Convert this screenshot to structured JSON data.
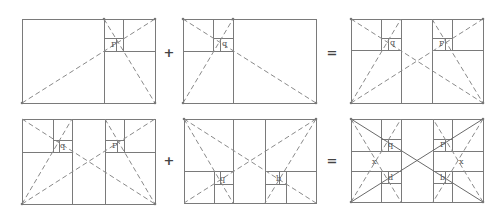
{
  "diagram": {
    "colors": {
      "line": "#7a7a7a",
      "dash": "#8a8a8a",
      "text": "#555555",
      "operator": "#444444",
      "background": "#ffffff"
    },
    "operators": [
      {
        "symbol": "+",
        "x": 169,
        "y": 57
      },
      {
        "symbol": "=",
        "x": 332,
        "y": 57
      },
      {
        "symbol": "+",
        "x": 169,
        "y": 165
      },
      {
        "symbol": "=",
        "x": 332,
        "y": 165
      }
    ],
    "panels": [
      {
        "id": "top-left",
        "rect": [
          22,
          19,
          155,
          103
        ],
        "lines": [
          [
            104,
            19,
            104,
            103
          ],
          [
            104,
            51,
            155,
            51
          ],
          [
            123,
            19,
            123,
            51
          ],
          [
            104,
            38,
            123,
            38
          ],
          [
            116,
            38,
            116,
            51
          ]
        ],
        "dashes": [
          [
            22,
            103,
            155,
            19
          ],
          [
            104,
            19,
            155,
            103
          ]
        ],
        "solids": [],
        "labels": [
          {
            "text": "P",
            "x": 111,
            "y": 47
          }
        ],
        "points": [
          [
            22,
            103
          ],
          [
            155,
            103
          ],
          [
            155,
            19
          ],
          [
            104,
            19
          ]
        ]
      },
      {
        "id": "top-middle",
        "rect": [
          183,
          19,
          316,
          103
        ],
        "lines": [
          [
            233,
            19,
            233,
            103
          ],
          [
            183,
            51,
            233,
            51
          ],
          [
            213,
            19,
            213,
            51
          ],
          [
            213,
            38,
            233,
            38
          ],
          [
            220,
            38,
            220,
            51
          ]
        ],
        "dashes": [
          [
            183,
            103,
            233,
            19
          ],
          [
            183,
            19,
            316,
            103
          ]
        ],
        "solids": [],
        "labels": [
          {
            "text": "q",
            "x": 222,
            "y": 46
          }
        ],
        "points": [
          [
            183,
            103
          ],
          [
            316,
            103
          ],
          [
            183,
            19
          ],
          [
            233,
            19
          ]
        ]
      },
      {
        "id": "top-right",
        "rect": [
          351,
          19,
          483,
          103
        ],
        "lines": [
          [
            401,
            19,
            401,
            103
          ],
          [
            432,
            19,
            432,
            103
          ],
          [
            351,
            50,
            401,
            50
          ],
          [
            381,
            19,
            381,
            50
          ],
          [
            381,
            38,
            401,
            38
          ],
          [
            388,
            38,
            388,
            50
          ],
          [
            432,
            50,
            483,
            50
          ],
          [
            452,
            19,
            452,
            50
          ],
          [
            432,
            38,
            452,
            38
          ],
          [
            445,
            38,
            445,
            50
          ]
        ],
        "dashes": [
          [
            351,
            103,
            483,
            19
          ],
          [
            351,
            19,
            483,
            103
          ],
          [
            351,
            103,
            401,
            19
          ],
          [
            432,
            19,
            483,
            103
          ]
        ],
        "solids": [],
        "labels": [
          {
            "text": "q",
            "x": 390,
            "y": 45
          },
          {
            "text": "P",
            "x": 439,
            "y": 46
          }
        ],
        "points": [
          [
            351,
            103
          ],
          [
            483,
            103
          ],
          [
            351,
            19
          ],
          [
            483,
            19
          ]
        ]
      },
      {
        "id": "bottom-left",
        "rect": [
          22,
          119,
          155,
          204
        ],
        "lines": [
          [
            72,
            119,
            72,
            204
          ],
          [
            105,
            119,
            105,
            204
          ],
          [
            22,
            152,
            72,
            152
          ],
          [
            53,
            119,
            53,
            152
          ],
          [
            53,
            140,
            72,
            140
          ],
          [
            59,
            140,
            59,
            152
          ],
          [
            105,
            152,
            155,
            152
          ],
          [
            124,
            119,
            124,
            152
          ],
          [
            105,
            140,
            124,
            140
          ],
          [
            117,
            140,
            117,
            152
          ]
        ],
        "dashes": [
          [
            22,
            204,
            155,
            119
          ],
          [
            22,
            119,
            155,
            204
          ],
          [
            22,
            204,
            72,
            119
          ],
          [
            105,
            119,
            155,
            204
          ]
        ],
        "solids": [],
        "labels": [
          {
            "text": "q",
            "x": 60,
            "y": 148
          },
          {
            "text": "P",
            "x": 112,
            "y": 148
          }
        ],
        "points": [
          [
            22,
            204
          ],
          [
            155,
            204
          ]
        ]
      },
      {
        "id": "bottom-middle",
        "rect": [
          184,
          119,
          316,
          203
        ],
        "lines": [
          [
            233,
            119,
            233,
            203
          ],
          [
            265,
            119,
            265,
            203
          ],
          [
            184,
            171,
            233,
            171
          ],
          [
            214,
            171,
            214,
            203
          ],
          [
            214,
            184,
            233,
            184
          ],
          [
            220,
            171,
            220,
            184
          ],
          [
            265,
            171,
            316,
            171
          ],
          [
            286,
            171,
            286,
            203
          ],
          [
            265,
            184,
            286,
            184
          ],
          [
            279,
            171,
            279,
            184
          ]
        ],
        "dashes": [
          [
            184,
            119,
            316,
            203
          ],
          [
            316,
            119,
            184,
            203
          ],
          [
            184,
            119,
            233,
            203
          ],
          [
            316,
            119,
            265,
            203
          ]
        ],
        "solids": [],
        "labels": [
          {
            "text": "q",
            "x": 220,
            "y": 181
          },
          {
            "text": "b",
            "x": 276,
            "y": 181
          }
        ],
        "points": [
          [
            184,
            119
          ],
          [
            316,
            119
          ]
        ]
      },
      {
        "id": "bottom-right",
        "rect": [
          351,
          119,
          483,
          202
        ],
        "lines": [
          [
            401,
            119,
            401,
            202
          ],
          [
            433,
            119,
            433,
            202
          ],
          [
            351,
            151,
            401,
            151
          ],
          [
            351,
            171,
            401,
            171
          ],
          [
            433,
            151,
            483,
            151
          ],
          [
            433,
            171,
            483,
            171
          ],
          [
            381,
            119,
            381,
            151
          ],
          [
            381,
            139,
            401,
            139
          ],
          [
            388,
            139,
            388,
            151
          ],
          [
            452,
            119,
            452,
            151
          ],
          [
            433,
            139,
            452,
            139
          ],
          [
            445,
            139,
            445,
            151
          ],
          [
            381,
            171,
            381,
            202
          ],
          [
            381,
            183,
            401,
            183
          ],
          [
            388,
            171,
            388,
            183
          ],
          [
            452,
            171,
            452,
            202
          ],
          [
            433,
            183,
            452,
            183
          ],
          [
            445,
            171,
            445,
            183
          ]
        ],
        "dashes": [
          [
            351,
            202,
            401,
            119
          ],
          [
            351,
            119,
            401,
            202
          ],
          [
            483,
            202,
            433,
            119
          ],
          [
            483,
            119,
            433,
            202
          ]
        ],
        "solids": [
          [
            351,
            119,
            483,
            202
          ],
          [
            351,
            202,
            483,
            119
          ]
        ],
        "labels": [
          {
            "text": "q",
            "x": 388,
            "y": 147
          },
          {
            "text": "P",
            "x": 440,
            "y": 147
          },
          {
            "text": "d",
            "x": 388,
            "y": 180
          },
          {
            "text": "b",
            "x": 440,
            "y": 180
          },
          {
            "text": "x",
            "x": 372,
            "y": 164
          },
          {
            "text": "x",
            "x": 459,
            "y": 164
          }
        ],
        "points": [
          [
            351,
            119
          ],
          [
            483,
            119
          ],
          [
            351,
            202
          ],
          [
            483,
            202
          ]
        ]
      }
    ]
  }
}
